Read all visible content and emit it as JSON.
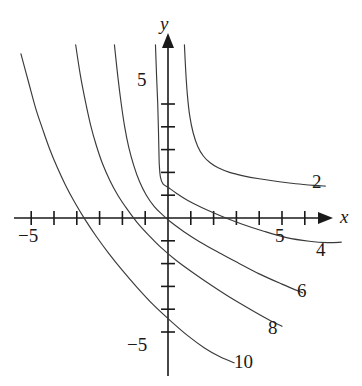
{
  "chart_data": {
    "type": "line",
    "title": "",
    "xlabel": "x",
    "ylabel": "y",
    "xlim": [
      -7.3,
      9.2
    ],
    "ylim": [
      -7.0,
      7.8
    ],
    "grid": false,
    "legend": "inline-curve-labels",
    "axis_labels": {
      "x_axis_name": "x",
      "y_axis_name": "y",
      "x_ticks_labeled": [
        {
          "value": -5,
          "label": "−5"
        },
        {
          "value": 5,
          "label": "5"
        }
      ],
      "y_ticks_labeled": [
        {
          "value": 5,
          "label": "5"
        },
        {
          "value": -5,
          "label": "−5"
        }
      ],
      "x_tick_values": [
        -6,
        -5,
        -4,
        -3,
        -2,
        -1,
        1,
        2,
        3,
        4,
        5,
        6
      ],
      "y_tick_values": [
        5,
        4,
        3,
        2,
        1,
        -1,
        -2,
        -3,
        -4,
        -5
      ]
    },
    "series": [
      {
        "name": "2",
        "label": "2",
        "label_position": [
          7.5,
          2.15
        ],
        "color": "#3a3a3a",
        "points": [
          [
            0.72,
            7.6
          ],
          [
            0.78,
            6.4
          ],
          [
            0.85,
            5.4
          ],
          [
            0.95,
            4.5
          ],
          [
            1.1,
            3.75
          ],
          [
            1.3,
            3.15
          ],
          [
            1.55,
            2.72
          ],
          [
            1.85,
            2.42
          ],
          [
            2.2,
            2.2
          ],
          [
            2.7,
            2.0
          ],
          [
            3.3,
            1.85
          ],
          [
            4.0,
            1.72
          ],
          [
            4.8,
            1.6
          ],
          [
            5.6,
            1.5
          ],
          [
            6.4,
            1.43
          ],
          [
            6.9,
            1.4
          ]
        ]
      },
      {
        "name": "4",
        "label": "4",
        "label_position": [
          7.6,
          -1.45
        ],
        "color": "#3a3a3a",
        "points": [
          [
            -0.55,
            7.6
          ],
          [
            -0.5,
            6.2
          ],
          [
            -0.45,
            5.0
          ],
          [
            -0.42,
            3.9
          ],
          [
            -0.4,
            3.0
          ],
          [
            -0.38,
            2.3
          ],
          [
            -0.33,
            1.78
          ],
          [
            -0.22,
            1.5
          ],
          [
            0.0,
            1.35
          ],
          [
            0.35,
            1.1
          ],
          [
            0.85,
            0.78
          ],
          [
            1.5,
            0.45
          ],
          [
            2.3,
            0.1
          ],
          [
            3.2,
            -0.25
          ],
          [
            4.2,
            -0.58
          ],
          [
            5.2,
            -0.86
          ],
          [
            6.2,
            -1.02
          ],
          [
            7.0,
            -1.08
          ],
          [
            7.6,
            -1.06
          ]
        ]
      },
      {
        "name": "6",
        "label": "6",
        "label_position": [
          6.9,
          -3.6
        ],
        "color": "#3a3a3a",
        "points": [
          [
            -2.35,
            7.6
          ],
          [
            -2.2,
            6.2
          ],
          [
            -2.05,
            5.0
          ],
          [
            -1.9,
            4.0
          ],
          [
            -1.72,
            3.1
          ],
          [
            -1.5,
            2.3
          ],
          [
            -1.25,
            1.6
          ],
          [
            -0.95,
            1.0
          ],
          [
            -0.6,
            0.5
          ],
          [
            -0.25,
            0.15
          ],
          [
            0.15,
            -0.2
          ],
          [
            0.7,
            -0.6
          ],
          [
            1.4,
            -1.05
          ],
          [
            2.2,
            -1.5
          ],
          [
            3.1,
            -1.98
          ],
          [
            4.0,
            -2.45
          ],
          [
            5.0,
            -2.9
          ],
          [
            5.9,
            -3.28
          ]
        ]
      },
      {
        "name": "8",
        "label": "8",
        "label_position": [
          5.9,
          -5.0
        ],
        "color": "#3a3a3a",
        "points": [
          [
            -4.05,
            7.6
          ],
          [
            -3.85,
            6.3
          ],
          [
            -3.62,
            5.1
          ],
          [
            -3.4,
            4.1
          ],
          [
            -3.15,
            3.2
          ],
          [
            -2.88,
            2.4
          ],
          [
            -2.55,
            1.65
          ],
          [
            -2.2,
            1.0
          ],
          [
            -1.8,
            0.4
          ],
          [
            -1.35,
            -0.2
          ],
          [
            -0.85,
            -0.75
          ],
          [
            -0.3,
            -1.3
          ],
          [
            0.35,
            -1.85
          ],
          [
            1.1,
            -2.4
          ],
          [
            1.9,
            -2.95
          ],
          [
            2.75,
            -3.5
          ],
          [
            3.6,
            -4.0
          ],
          [
            4.4,
            -4.45
          ],
          [
            5.0,
            -4.75
          ]
        ]
      },
      {
        "name": "10",
        "label": "10",
        "label_position": [
          3.9,
          -6.5
        ],
        "color": "#3a3a3a",
        "points": [
          [
            -6.45,
            7.2
          ],
          [
            -6.1,
            5.9
          ],
          [
            -5.8,
            4.8
          ],
          [
            -5.5,
            3.9
          ],
          [
            -5.2,
            3.05
          ],
          [
            -4.85,
            2.2
          ],
          [
            -4.5,
            1.45
          ],
          [
            -4.1,
            0.7
          ],
          [
            -3.65,
            -0.05
          ],
          [
            -3.15,
            -0.8
          ],
          [
            -2.6,
            -1.55
          ],
          [
            -2.0,
            -2.3
          ],
          [
            -1.35,
            -3.05
          ],
          [
            -0.65,
            -3.8
          ],
          [
            0.1,
            -4.5
          ],
          [
            0.85,
            -5.15
          ],
          [
            1.6,
            -5.7
          ],
          [
            2.3,
            -6.1
          ],
          [
            2.9,
            -6.35
          ]
        ]
      }
    ]
  },
  "labels": {
    "y_axis": "y",
    "x_axis": "x",
    "y_five": "5",
    "y_neg_five": "−5",
    "x_five": "5",
    "x_neg_five": "−5",
    "curve_2": "2",
    "curve_4": "4",
    "curve_6": "6",
    "curve_8": "8",
    "curve_10": "10"
  },
  "style": {
    "curve_color": "#3a3a3a",
    "axis_color": "#1a1a1a",
    "text_color": "#1a1a1a",
    "background": "#ffffff"
  }
}
